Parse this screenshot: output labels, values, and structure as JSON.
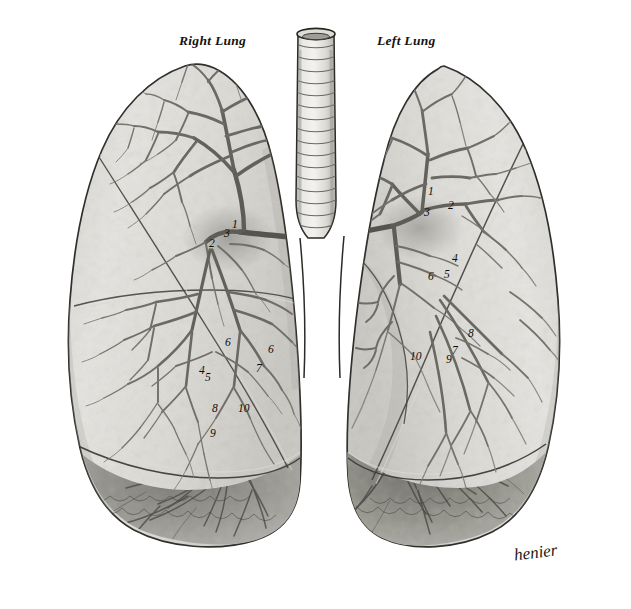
{
  "plate": {
    "width": 631,
    "height": 609,
    "background_color": "#ffffff",
    "medium": "steel engraving / lithograph, monochrome grey wash",
    "subject": "Anterior view of the two lungs with trachea and the bronchial tree dissected in situ"
  },
  "titles": [
    {
      "id": "right-lung",
      "text": "Right Lung",
      "x": 179,
      "y": 33
    },
    {
      "id": "left-lung",
      "text": "Left Lung",
      "x": 377,
      "y": 33
    }
  ],
  "signature": {
    "text": "henier",
    "x": 514,
    "y": 543
  },
  "structures": {
    "trachea": {
      "name": "Trachea",
      "ring_count": 16,
      "top_y": 31,
      "bottom_y": 232
    },
    "carina": {
      "name": "Carina / bifurcation",
      "x": 315,
      "y": 238
    },
    "right_lung": {
      "name": "Right Lung",
      "lobes": [
        "Superior lobe",
        "Middle lobe",
        "Inferior lobe"
      ],
      "fissures": [
        "Horizontal fissure",
        "Oblique fissure"
      ]
    },
    "left_lung": {
      "name": "Left Lung",
      "lobes": [
        "Superior lobe",
        "Inferior lobe"
      ],
      "fissures": [
        "Oblique fissure"
      ],
      "features": [
        "Cardiac notch"
      ]
    }
  },
  "numbers": {
    "right_lung": [
      {
        "text": "1",
        "x": 232,
        "y": 225
      },
      {
        "text": "2",
        "x": 209,
        "y": 244
      },
      {
        "text": "3",
        "x": 224,
        "y": 234
      },
      {
        "text": "4",
        "x": 199,
        "y": 371
      },
      {
        "text": "5",
        "x": 205,
        "y": 378
      },
      {
        "text": "6",
        "x": 225,
        "y": 343
      },
      {
        "text": "6",
        "x": 268,
        "y": 350
      },
      {
        "text": "7",
        "x": 256,
        "y": 369
      },
      {
        "text": "8",
        "x": 212,
        "y": 409
      },
      {
        "text": "9",
        "x": 210,
        "y": 434
      },
      {
        "text": "10",
        "x": 240,
        "y": 409
      }
    ],
    "left_lung": [
      {
        "text": "1",
        "x": 428,
        "y": 192
      },
      {
        "text": "2",
        "x": 448,
        "y": 206
      },
      {
        "text": "3",
        "x": 424,
        "y": 213
      },
      {
        "text": "4",
        "x": 452,
        "y": 259
      },
      {
        "text": "5",
        "x": 444,
        "y": 275
      },
      {
        "text": "6",
        "x": 428,
        "y": 277
      },
      {
        "text": "7",
        "x": 452,
        "y": 351
      },
      {
        "text": "8",
        "x": 468,
        "y": 334
      },
      {
        "text": "9",
        "x": 446,
        "y": 360
      },
      {
        "text": "10",
        "x": 412,
        "y": 357
      }
    ]
  },
  "palette": {
    "paper": "#ffffff",
    "lung_fill_light": "#e2e1dd",
    "lung_fill_mid": "#d2d1cc",
    "lung_fill_dark": "#b9b8b3",
    "shadow_deep": "#8d8c88",
    "shadow_deeper": "#6f6e6a",
    "outline": "#2b2a27",
    "bronchus": "#6b6a66",
    "bronchus_dark": "#4a4946",
    "label_ink": "#0d0c0a"
  }
}
